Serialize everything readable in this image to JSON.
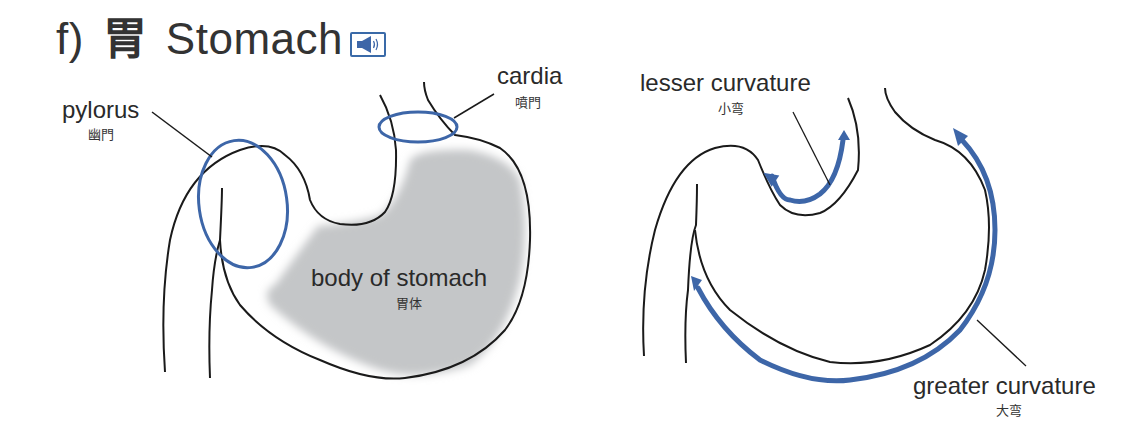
{
  "title": {
    "prefix": "f)",
    "kanji": "胃",
    "english": "Stomach",
    "audio_icon": "speaker-icon"
  },
  "left_figure": {
    "labels": {
      "pylorus": {
        "en": "pylorus",
        "jp": "幽門"
      },
      "cardia": {
        "en": "cardia",
        "jp": "噴門"
      },
      "body": {
        "en": "body of stomach",
        "jp": "胃体"
      }
    }
  },
  "right_figure": {
    "labels": {
      "lesser": {
        "en": "lesser curvature",
        "jp": "小弯"
      },
      "greater": {
        "en": "greater curvature",
        "jp": "大弯"
      }
    }
  },
  "colors": {
    "outline": "#1a1a1a",
    "highlight_blue": "#3d66a8",
    "body_fill": "#c4c6c8"
  }
}
